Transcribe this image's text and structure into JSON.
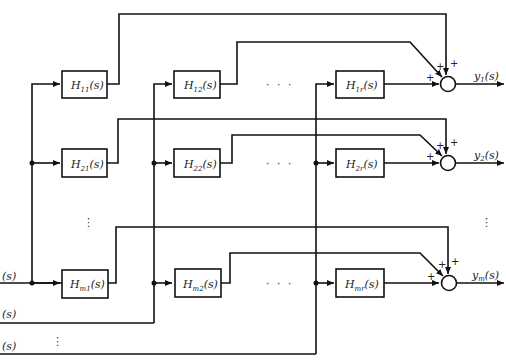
{
  "diagram": {
    "type": "MIMO transfer function block diagram",
    "blocks": {
      "h11": {
        "main": "H",
        "sub": "11",
        "arg": "(s)"
      },
      "h12": {
        "main": "H",
        "sub": "12",
        "arg": "(s)"
      },
      "h1r": {
        "main": "H",
        "sub": "1r",
        "arg": "(s)"
      },
      "h21": {
        "main": "H",
        "sub": "21",
        "arg": "(s)"
      },
      "h22": {
        "main": "H",
        "sub": "22",
        "arg": "(s)"
      },
      "h2r": {
        "main": "H",
        "sub": "2r",
        "arg": "(s)"
      },
      "hm1": {
        "main": "H",
        "sub": "m1",
        "arg": "(s)"
      },
      "hm2": {
        "main": "H",
        "sub": "m2",
        "arg": "(s)"
      },
      "hmr": {
        "main": "H",
        "sub": "mr",
        "arg": "(s)"
      }
    },
    "outputs": {
      "y1": {
        "main": "y",
        "sub": "1",
        "arg": "(s)"
      },
      "y2": {
        "main": "y",
        "sub": "2",
        "arg": "(s)"
      },
      "ym": {
        "main": "y",
        "sub": "m",
        "arg": "(s)"
      }
    },
    "inputs": {
      "u1": "(s)",
      "u2": "(s)",
      "ur": "(s)"
    },
    "signs": {
      "plus": "+"
    },
    "ellipsis_h": "· · ·",
    "ellipsis_v": "⋮"
  }
}
